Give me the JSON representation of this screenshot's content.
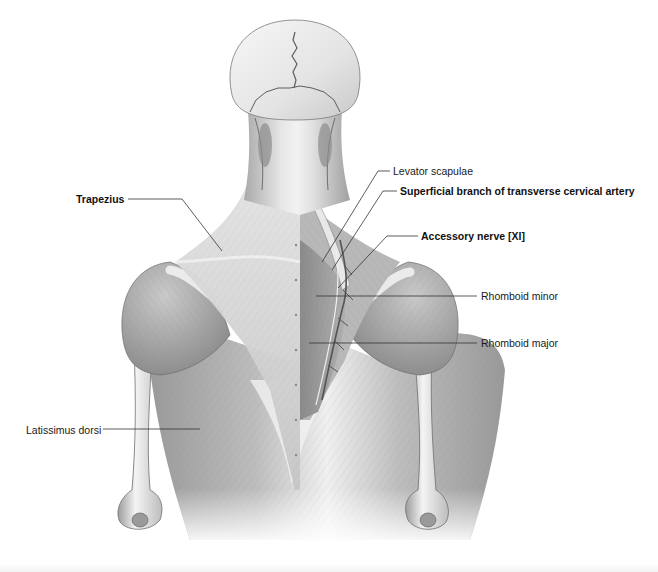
{
  "figure": {
    "colors": {
      "background": "#ffffff",
      "muscle_dark": "#8d8d8d",
      "muscle_mid": "#b4b4b4",
      "muscle_light": "#d6d6d6",
      "bone": "#ececec",
      "leader_line": "#333333",
      "label_text": "#1a1a1a"
    }
  },
  "labels": [
    {
      "id": "levator-scapulae",
      "text": "Levator scapulae",
      "bold": false,
      "x": 393,
      "y": 165
    },
    {
      "id": "superficial-branch-tca",
      "text": "Superficial branch of transverse cervical artery",
      "bold": true,
      "x": 400,
      "y": 185
    },
    {
      "id": "trapezius",
      "text": "Trapezius",
      "bold": true,
      "x": 76,
      "y": 193
    },
    {
      "id": "accessory-nerve",
      "text": "Accessory nerve [XI]",
      "bold": true,
      "x": 421,
      "y": 230
    },
    {
      "id": "rhomboid-minor",
      "text": "Rhomboid minor",
      "bold": false,
      "x": 481,
      "y": 290
    },
    {
      "id": "rhomboid-major",
      "text": "Rhomboid major",
      "bold": false,
      "x": 481,
      "y": 337
    },
    {
      "id": "latissimus-dorsi",
      "text": "Latissimus dorsi",
      "bold": false,
      "x": 26,
      "y": 424
    }
  ],
  "leaders": [
    {
      "id": "levator-scapulae",
      "points": "390,171 378,171 322,262"
    },
    {
      "id": "superficial-branch-tca",
      "points": "397,191 383,191 332,270"
    },
    {
      "id": "trapezius",
      "points": "128,199 182,199 222,251"
    },
    {
      "id": "accessory-nerve",
      "points": "418,236 387,236 338,288"
    },
    {
      "id": "rhomboid-minor",
      "points": "477,296 316,296"
    },
    {
      "id": "rhomboid-major",
      "points": "477,343 309,343"
    },
    {
      "id": "latissimus-dorsi",
      "points": "103,429 200,429"
    }
  ]
}
